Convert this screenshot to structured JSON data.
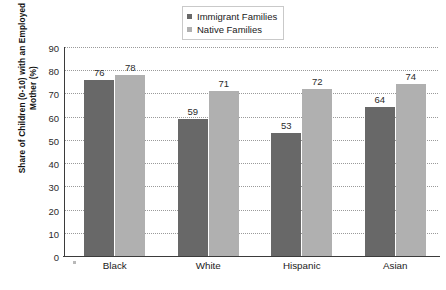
{
  "chart_data": {
    "type": "bar",
    "title": "",
    "subtitle": "",
    "xlabel": "",
    "ylabel": "Share of Children (0-10) with an Employed Mother (%)",
    "categories": [
      "Black",
      "White",
      "Hispanic",
      "Asian"
    ],
    "series": [
      {
        "name": "Immigrant Families",
        "values": [
          76,
          59,
          53,
          64
        ],
        "color": "#686868"
      },
      {
        "name": "Native Families",
        "values": [
          78,
          71,
          72,
          74
        ],
        "color": "#b0b0b0"
      }
    ],
    "ylim": [
      0,
      90
    ],
    "ytick_step": 10,
    "yticks": [
      0,
      10,
      20,
      30,
      40,
      50,
      60,
      70,
      80,
      90
    ],
    "ytick_labels": [
      "0",
      "10",
      "20",
      "30",
      "40",
      "50",
      "60",
      "70",
      "80",
      "90"
    ],
    "grid": "horizontal-dotted",
    "legend_position": "top-center",
    "data_labels": true
  },
  "axis": {
    "y_title": "Share of Children (0-10) with an Employed Mother (%)"
  },
  "legend": {
    "items": [
      {
        "label": "Immigrant Families",
        "color": "#686868"
      },
      {
        "label": "Native Families",
        "color": "#b0b0b0"
      }
    ]
  },
  "colors": {
    "immigrant_bar": "#686868",
    "native_bar": "#b0b0b0",
    "axis_line": "#3b3b3b",
    "gridline": "#9a9a9a",
    "background": "#ffffff",
    "text": "#1a1a1a"
  }
}
